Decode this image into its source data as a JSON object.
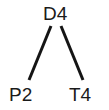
{
  "diagram": {
    "type": "tree-graph",
    "background_color": "#ffffff",
    "edge_color": "#151515",
    "label_color": "#1a1a1a",
    "edge_width": 3,
    "nodes": [
      {
        "id": "d4",
        "label": "D4",
        "role": "root",
        "x": 55,
        "y": 13
      },
      {
        "id": "p2",
        "label": "P2",
        "role": "leaf-left",
        "x": 22,
        "y": 94
      },
      {
        "id": "t4",
        "label": "T4",
        "role": "leaf-right",
        "x": 82,
        "y": 94
      }
    ],
    "edges": [
      {
        "id": "edge-d4-p2",
        "from": "D4",
        "to": "P2",
        "x1": 51,
        "y1": 26,
        "x2": 29,
        "y2": 80
      },
      {
        "id": "edge-d4-t4",
        "from": "D4",
        "to": "T4",
        "x1": 61,
        "y1": 26,
        "x2": 83,
        "y2": 80
      }
    ]
  }
}
